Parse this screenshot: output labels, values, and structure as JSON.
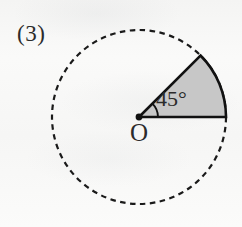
{
  "figure": {
    "item_number": "(3)",
    "origin_label": "O",
    "angle_label": "45°",
    "angle_degrees": 45,
    "circle": {
      "center_x": 139,
      "center_y": 117,
      "radius": 87,
      "stroke_style": "dashed",
      "stroke_color": "#1a1a1a"
    },
    "sector": {
      "start_degrees": 0,
      "end_degrees": 45,
      "fill_color": "#c7c7c7",
      "stroke_color": "#111111",
      "stroke_style": "solid"
    },
    "center_dot": {
      "color": "#111111",
      "radius": 3.2
    },
    "angle_arc_marker": {
      "radius": 19,
      "color": "#111111"
    },
    "background_color": "#f7f7f6"
  }
}
